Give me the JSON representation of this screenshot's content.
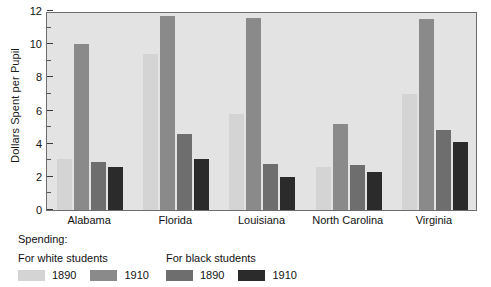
{
  "chart_data": {
    "type": "bar",
    "title": "",
    "subtitle": "",
    "xlabel": "",
    "ylabel": "Dollars Spent per Pupil",
    "ylim": [
      0,
      12
    ],
    "ytick_major_step": 2,
    "ytick_minor_step": 1,
    "ytick_labels": [
      "0",
      "2",
      "4",
      "6",
      "8",
      "10",
      "12"
    ],
    "grid": false,
    "legend_position": "below-plot",
    "categories": [
      "Alabama",
      "Florida",
      "Louisiana",
      "North Carolina",
      "Virginia"
    ],
    "series": [
      {
        "name": "For white students 1890",
        "group": "For white students",
        "year": "1890",
        "color": "#d4d4d4",
        "values": [
          3.1,
          9.4,
          5.8,
          2.6,
          7.0
        ]
      },
      {
        "name": "For white students 1910",
        "group": "For white students",
        "year": "1910",
        "color": "#8a8a8a",
        "values": [
          10.0,
          11.7,
          11.6,
          5.2,
          11.5
        ]
      },
      {
        "name": "For black students 1890",
        "group": "For black students",
        "year": "1890",
        "color": "#6e6e6e",
        "values": [
          2.9,
          4.6,
          2.8,
          2.7,
          4.8
        ]
      },
      {
        "name": "For black students 1910",
        "group": "For black students",
        "year": "1910",
        "color": "#2b2b2b",
        "values": [
          2.6,
          3.1,
          2.0,
          2.3,
          4.1
        ]
      }
    ]
  },
  "axis": {
    "ylabel": "Dollars Spent per Pupil"
  },
  "legend": {
    "title": "Spending:",
    "white_heading": "For white students",
    "black_heading": "For black students",
    "white_1890": "1890",
    "white_1910": "1910",
    "black_1890": "1890",
    "black_1910": "1910"
  },
  "colors": {
    "plot_background": "#e3e3e3",
    "plot_border": "#6d6d6d",
    "white_1890": "#d4d4d4",
    "white_1910": "#8a8a8a",
    "black_1890": "#6e6e6e",
    "black_1910": "#2b2b2b",
    "text": "#111111"
  }
}
